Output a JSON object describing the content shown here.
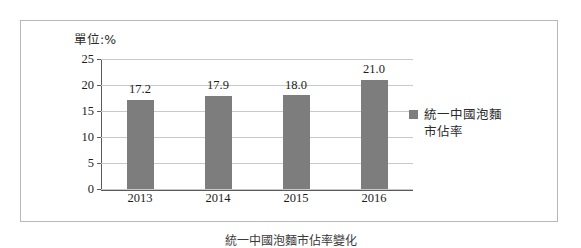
{
  "figure": {
    "unit_label": "單位:%",
    "caption": "統一中國泡麵市佔率變化"
  },
  "chart_data": {
    "type": "bar",
    "title": "",
    "subtitle": "",
    "unit_note": "單位:%",
    "xlabel": "",
    "ylabel": "",
    "categories": [
      "2013",
      "2014",
      "2015",
      "2016"
    ],
    "values": [
      17.2,
      17.9,
      18.0,
      21.0
    ],
    "data_labels": [
      "17.2",
      "17.9",
      "18.0",
      "21.0"
    ],
    "series": [
      {
        "name": "統一中國泡麵\n市佔率",
        "values": [
          17.2,
          17.9,
          18.0,
          21.0
        ],
        "color": "#7d7d7d"
      }
    ],
    "ylim": [
      0,
      25
    ],
    "ytick_values": [
      25,
      20,
      15,
      10,
      5,
      0
    ],
    "ytick_labels": [
      "25",
      "20",
      "15",
      "10",
      "5",
      "0"
    ],
    "grid": true,
    "grid_color": "#c9c9c9",
    "legend_position": "right",
    "legend_entries": [
      "統一中國泡麵\n市佔率"
    ],
    "axis_color": "#5a5a5a",
    "background": "#ffffff"
  }
}
